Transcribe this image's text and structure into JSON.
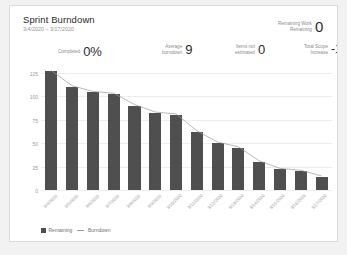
{
  "card": {
    "title": "Sprint Burndown",
    "subtitle": "3/4/2020 – 3/17/2020"
  },
  "kpis": [
    {
      "key": "remaining_work",
      "label_line1": "Remaining Work",
      "label_line2": "Remaining",
      "value": "0"
    },
    {
      "key": "completed",
      "label_line1": "Completed",
      "label_line2": "",
      "value": "0%"
    },
    {
      "key": "average_burndown",
      "label_line1": "Average",
      "label_line2": "burndown",
      "value": "9"
    },
    {
      "key": "items_not_estimated",
      "label_line1": "Items not",
      "label_line2": "estimated",
      "value": "0"
    },
    {
      "key": "total_scope_increase",
      "label_line1": "Total Scope",
      "label_line2": "Increase",
      "value": "-127"
    }
  ],
  "legend": [
    {
      "name": "Remaining",
      "marker": "square",
      "color": "#4f4f4f"
    },
    {
      "name": "Burndown",
      "marker": "line",
      "color": "#9a9a9a"
    }
  ],
  "chart_data": {
    "type": "bar",
    "title": "Sprint Burndown",
    "xlabel": "",
    "ylabel": "",
    "ylim": [
      0,
      131
    ],
    "yticks": [
      0,
      25,
      50,
      75,
      100,
      125
    ],
    "grid": true,
    "legend_position": "bottom-left",
    "categories": [
      "3/4/2020",
      "3/5/2020",
      "3/6/2020",
      "3/7/2020",
      "3/8/2020",
      "3/9/2020",
      "3/10/2020",
      "3/11/2020",
      "3/12/2020",
      "3/13/2020",
      "3/14/2020",
      "3/15/2020",
      "3/16/2020",
      "3/17/2020"
    ],
    "series": [
      {
        "name": "Remaining",
        "type": "bar",
        "color": "#4f4f4f",
        "values": [
          127,
          110,
          104,
          102,
          90,
          82,
          80,
          62,
          50,
          45,
          30,
          22,
          20,
          14
        ]
      },
      {
        "name": "Burndown",
        "type": "line",
        "color": "#9a9a9a",
        "values": [
          127,
          111,
          105,
          103,
          91,
          83,
          81,
          63,
          51,
          46,
          31,
          23,
          21,
          15
        ]
      }
    ]
  }
}
